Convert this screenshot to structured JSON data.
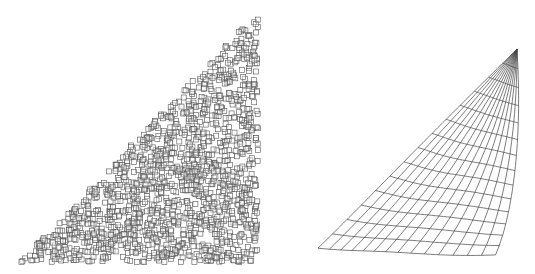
{
  "figure": {
    "panels": [
      {
        "id": "left",
        "kind": "point-cloud",
        "description": "Random point distribution drawn as small hollow squares filling a right triangle",
        "triangle": [
          [
            20,
            262
          ],
          [
            258,
            12
          ],
          [
            258,
            262
          ]
        ],
        "marker": {
          "shape": "square",
          "size": 5,
          "stroke": "#555555",
          "fill": "none"
        },
        "point_count": 1500,
        "seed": 7
      },
      {
        "id": "right",
        "kind": "deformed-mesh",
        "description": "Structured quadrilateral mesh mapped onto a curved triangular region",
        "corners": {
          "bottom_left": [
            48,
            247
          ],
          "top_right": [
            247,
            49
          ],
          "right_mid": [
            250,
            200
          ],
          "bottom_right": [
            195,
            254
          ]
        },
        "rows": 14,
        "cols": 14,
        "stroke": "#444444",
        "stroke_width": 0.7
      }
    ]
  }
}
